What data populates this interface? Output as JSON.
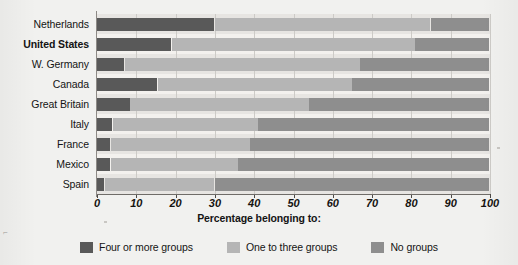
{
  "chart_data": {
    "type": "bar",
    "orientation": "horizontal",
    "stacked": true,
    "title": "",
    "xlabel": "Percentage belonging to:",
    "ylabel": "",
    "xlim": [
      0,
      100
    ],
    "xticks": [
      0,
      10,
      20,
      30,
      40,
      50,
      60,
      70,
      80,
      90,
      100
    ],
    "xticklabels": [
      "0",
      "10",
      "20",
      "30",
      "40",
      "50",
      "60",
      "70",
      "80",
      "90",
      "100"
    ],
    "grid": true,
    "legend_position": "bottom",
    "categories": [
      "Netherlands",
      "United States",
      "W. Germany",
      "Canada",
      "Great Britain",
      "Italy",
      "France",
      "Mexico",
      "Spain"
    ],
    "highlight_category": "United States",
    "series": [
      {
        "name": "Four or more groups",
        "color": "#595959",
        "values": [
          30,
          19,
          7,
          15.5,
          8.5,
          4,
          3.5,
          3.5,
          2
        ]
      },
      {
        "name": "One to three groups",
        "color": "#b5b5b5",
        "values": [
          55,
          62,
          60,
          49.5,
          45.5,
          37,
          35.5,
          32.5,
          28
        ]
      },
      {
        "name": "No groups",
        "color": "#8e8e8e",
        "values": [
          15,
          19,
          33,
          35,
          46,
          59,
          61,
          64,
          70
        ]
      }
    ]
  },
  "legend": {
    "items": [
      {
        "label": "Four or more groups",
        "color": "#595959"
      },
      {
        "label": "One to three groups",
        "color": "#b5b5b5"
      },
      {
        "label": "No groups",
        "color": "#8e8e8e"
      }
    ]
  }
}
